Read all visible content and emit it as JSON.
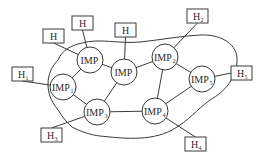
{
  "diagram": {
    "title": "",
    "imps": [
      {
        "id": "imp-a",
        "label": "IMP",
        "sub": "",
        "cx": 90,
        "cy": 60
      },
      {
        "id": "imp-b",
        "label": "IMP",
        "sub": "",
        "cx": 124,
        "cy": 72
      },
      {
        "id": "imp1",
        "label": "IMP",
        "sub": "1",
        "cx": 63,
        "cy": 87
      },
      {
        "id": "imp2",
        "label": "IMP",
        "sub": "2",
        "cx": 165,
        "cy": 57
      },
      {
        "id": "imp3",
        "label": "IMP",
        "sub": "3",
        "cx": 97,
        "cy": 112
      },
      {
        "id": "imp4",
        "label": "IMP",
        "sub": "4",
        "cx": 155,
        "cy": 111
      },
      {
        "id": "imp5",
        "label": "IMP",
        "sub": "5",
        "cx": 202,
        "cy": 79
      }
    ],
    "hosts": [
      {
        "id": "h-a",
        "label": "H",
        "sub": "",
        "x": 43,
        "y": 29,
        "attach": "imp-a"
      },
      {
        "id": "h-b",
        "label": "H",
        "sub": "",
        "x": 72,
        "y": 16,
        "attach": "imp-a"
      },
      {
        "id": "h-c",
        "label": "H",
        "sub": "",
        "x": 115,
        "y": 23,
        "attach": "imp-b"
      },
      {
        "id": "h1",
        "label": "H",
        "sub": "1",
        "x": 12,
        "y": 67,
        "attach": "imp1"
      },
      {
        "id": "h2",
        "label": "H",
        "sub": "2",
        "x": 187,
        "y": 9,
        "attach": "imp2"
      },
      {
        "id": "h3",
        "label": "H",
        "sub": "3",
        "x": 41,
        "y": 128,
        "attach": "imp3"
      },
      {
        "id": "h4",
        "label": "H",
        "sub": "4",
        "x": 185,
        "y": 137,
        "attach": "imp4"
      },
      {
        "id": "h5",
        "label": "H",
        "sub": "5",
        "x": 231,
        "y": 66,
        "attach": "imp5"
      }
    ],
    "links": [
      [
        "imp-a",
        "imp-b"
      ],
      [
        "imp-a",
        "imp1"
      ],
      [
        "imp-b",
        "imp2"
      ],
      [
        "imp-b",
        "imp3"
      ],
      [
        "imp1",
        "imp3"
      ],
      [
        "imp2",
        "imp5"
      ],
      [
        "imp2",
        "imp4"
      ],
      [
        "imp3",
        "imp4"
      ],
      [
        "imp4",
        "imp5"
      ]
    ]
  }
}
